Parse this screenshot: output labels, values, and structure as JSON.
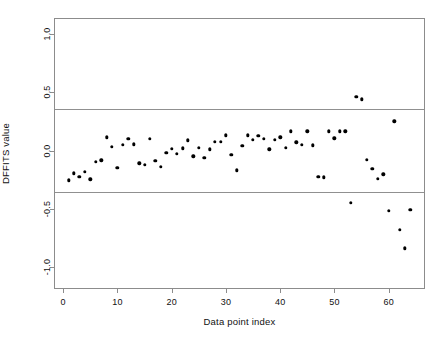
{
  "figure": {
    "background_color": "#ffffff",
    "frame_color": "#8c8c8c",
    "point_color": "#000000",
    "threshold_color": "#909090"
  },
  "chart_data": {
    "type": "scatter",
    "title": "",
    "xlabel": "Data point index",
    "ylabel": "DFFITS value",
    "xlim": [
      -1.5,
      66.5
    ],
    "ylim": [
      -1.18,
      1.13
    ],
    "grid": false,
    "legend": null,
    "xticks": [
      0,
      10,
      20,
      30,
      40,
      50,
      60
    ],
    "xticklabels": [
      "0",
      "10",
      "20",
      "30",
      "40",
      "50",
      "60"
    ],
    "yticks": [
      1.0,
      0.5,
      0.0,
      -0.5,
      -1.0
    ],
    "yticklabels": [
      "1.0",
      "0.5",
      "0.0",
      "-0.5",
      "-1.0"
    ],
    "thresholds": [
      {
        "name": "upper-dffits-threshold",
        "value": 0.354
      },
      {
        "name": "lower-dffits-threshold",
        "value": -0.354
      }
    ],
    "x": [
      1,
      2,
      3,
      4,
      5,
      6,
      7,
      8,
      9,
      10,
      11,
      12,
      13,
      14,
      15,
      16,
      17,
      18,
      19,
      20,
      21,
      22,
      23,
      24,
      25,
      26,
      27,
      28,
      29,
      30,
      31,
      32,
      33,
      34,
      35,
      36,
      37,
      38,
      39,
      40,
      41,
      42,
      43,
      44,
      45,
      46,
      47,
      48,
      49,
      50,
      51,
      52,
      53,
      54,
      55,
      56,
      57,
      58,
      59,
      60,
      61,
      62,
      63,
      64
    ],
    "y": [
      -0.255,
      -0.195,
      -0.225,
      -0.18,
      -0.245,
      -0.095,
      -0.085,
      0.115,
      0.035,
      -0.15,
      0.05,
      0.1,
      0.055,
      -0.11,
      -0.12,
      0.1,
      -0.09,
      -0.14,
      -0.02,
      0.015,
      -0.03,
      0.02,
      0.09,
      -0.05,
      0.025,
      -0.06,
      0.01,
      0.075,
      0.075,
      0.13,
      -0.035,
      -0.17,
      0.04,
      0.13,
      0.095,
      0.125,
      0.1,
      0.01,
      0.095,
      0.115,
      0.025,
      0.165,
      0.07,
      0.05,
      0.165,
      0.045,
      -0.225,
      -0.23,
      0.165,
      0.105,
      0.165,
      0.165,
      -0.45,
      0.46,
      0.44,
      -0.08,
      -0.155,
      -0.24,
      -0.205,
      -0.515,
      0.25,
      -0.68,
      -0.84,
      -0.51
    ],
    "series_name": "DFFITS"
  },
  "axis_titles": {
    "x": "Data point index",
    "y": "DFFITS value"
  }
}
